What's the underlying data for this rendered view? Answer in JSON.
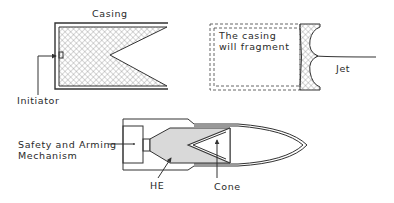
{
  "figure": {
    "panels": [
      {
        "id": "shaped-charge",
        "labels": {
          "casing": "Casing",
          "initiator": "Initiator"
        }
      },
      {
        "id": "jet-formation",
        "labels": {
          "fragment": [
            "The casing",
            "will fragment"
          ],
          "jet": "Jet"
        }
      },
      {
        "id": "heat-round",
        "labels": {
          "safety": [
            "Safety and Arming",
            "Mechanism"
          ],
          "he": "HE",
          "cone": "Cone"
        }
      }
    ],
    "colors": {
      "line": "#333333",
      "fill_hatch": "#888888",
      "he_fill": "#d9d9d9",
      "background": "#ffffff"
    }
  }
}
